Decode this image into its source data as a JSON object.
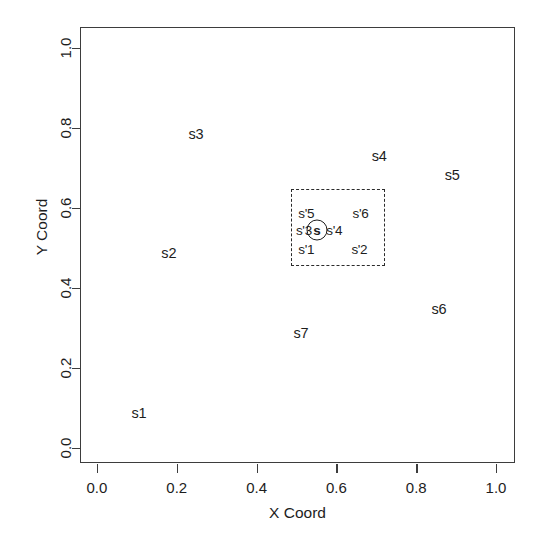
{
  "chart_data": {
    "type": "scatter",
    "title": "",
    "xlabel": "X Coord",
    "ylabel": "Y Coord",
    "xlim": [
      -0.04,
      1.05
    ],
    "ylim": [
      -0.04,
      1.05
    ],
    "grid": false,
    "legend": null,
    "xticks": [
      "0.0",
      "0.2",
      "0.4",
      "0.6",
      "0.8",
      "1.0"
    ],
    "xtick_values": [
      0.0,
      0.2,
      0.4,
      0.6,
      0.8,
      1.0
    ],
    "yticks": [
      "0.0",
      "0.2",
      "0.4",
      "0.6",
      "0.8",
      "1.0"
    ],
    "ytick_values": [
      0.0,
      0.2,
      0.4,
      0.6,
      0.8,
      1.0
    ],
    "points": [
      {
        "label": "s1",
        "x": 0.105,
        "y": 0.087
      },
      {
        "label": "s2",
        "x": 0.18,
        "y": 0.488
      },
      {
        "label": "s3",
        "x": 0.248,
        "y": 0.785
      },
      {
        "label": "s4",
        "x": 0.707,
        "y": 0.73
      },
      {
        "label": "s5",
        "x": 0.89,
        "y": 0.683
      },
      {
        "label": "s6",
        "x": 0.857,
        "y": 0.347
      },
      {
        "label": "s7",
        "x": 0.511,
        "y": 0.287
      }
    ],
    "inset": {
      "x0": 0.487,
      "y0": 0.455,
      "x1": 0.722,
      "y1": 0.648,
      "border_style": "dashed",
      "center_marker": {
        "label": "s",
        "x": 0.549,
        "y": 0.548,
        "shape": "circle"
      },
      "points": [
        {
          "label": "s'5",
          "x": 0.522,
          "y": 0.59
        },
        {
          "label": "s'6",
          "x": 0.658,
          "y": 0.59
        },
        {
          "label": "s'3",
          "x": 0.516,
          "y": 0.548
        },
        {
          "label": "s'4",
          "x": 0.592,
          "y": 0.548
        },
        {
          "label": "s'1",
          "x": 0.522,
          "y": 0.5
        },
        {
          "label": "s'2",
          "x": 0.655,
          "y": 0.5
        }
      ]
    }
  },
  "colors": {
    "background": "#ffffff",
    "axis": "#3d3d3d",
    "text": "#1d1d1d",
    "inset_border": "#2b2b2b"
  }
}
